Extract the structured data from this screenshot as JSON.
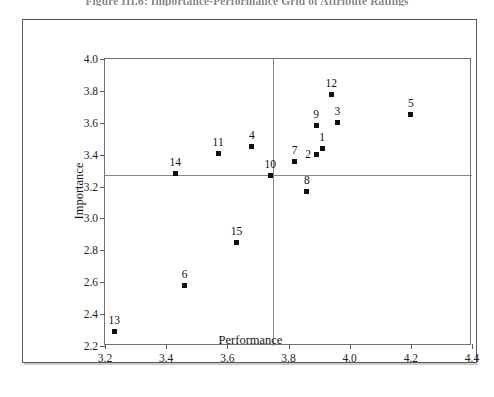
{
  "figure": {
    "caption": "Figure III.6: Importance-Performance Grid of Attribute Ratings"
  },
  "chart_data": {
    "type": "scatter",
    "title": "Figure III.6: Importance-Performance Grid of Attribute Ratings",
    "xlabel": "Performance",
    "ylabel": "Importance",
    "xlim": [
      3.2,
      4.4
    ],
    "ylim": [
      2.2,
      4.0
    ],
    "xticks": [
      "3.2",
      "3.4",
      "3.6",
      "3.8",
      "4.0",
      "4.2",
      "4.4"
    ],
    "yticks": [
      "2.2",
      "2.4",
      "2.6",
      "2.8",
      "3.0",
      "3.2",
      "3.4",
      "3.6",
      "3.8",
      "4.0"
    ],
    "xtick_values": [
      3.2,
      3.4,
      3.6,
      3.8,
      4.0,
      4.2,
      4.4
    ],
    "ytick_values": [
      2.2,
      2.4,
      2.6,
      2.8,
      3.0,
      3.2,
      3.4,
      3.6,
      3.8,
      4.0
    ],
    "grid": false,
    "legend": null,
    "quadrant_lines": {
      "x": 3.75,
      "y": 3.27
    },
    "points": [
      {
        "label": "1",
        "x": 3.91,
        "y": 3.44,
        "label_pos": "top"
      },
      {
        "label": "2",
        "x": 3.89,
        "y": 3.4,
        "label_pos": "left"
      },
      {
        "label": "3",
        "x": 3.96,
        "y": 3.6,
        "label_pos": "top"
      },
      {
        "label": "4",
        "x": 3.68,
        "y": 3.45,
        "label_pos": "top"
      },
      {
        "label": "5",
        "x": 4.2,
        "y": 3.65,
        "label_pos": "top"
      },
      {
        "label": "6",
        "x": 3.46,
        "y": 2.58,
        "label_pos": "top"
      },
      {
        "label": "7",
        "x": 3.82,
        "y": 3.36,
        "label_pos": "top"
      },
      {
        "label": "8",
        "x": 3.86,
        "y": 3.17,
        "label_pos": "top"
      },
      {
        "label": "9",
        "x": 3.89,
        "y": 3.58,
        "label_pos": "top"
      },
      {
        "label": "10",
        "x": 3.74,
        "y": 3.27,
        "label_pos": "top"
      },
      {
        "label": "11",
        "x": 3.57,
        "y": 3.41,
        "label_pos": "top"
      },
      {
        "label": "12",
        "x": 3.94,
        "y": 3.78,
        "label_pos": "top"
      },
      {
        "label": "13",
        "x": 3.23,
        "y": 2.29,
        "label_pos": "top"
      },
      {
        "label": "14",
        "x": 3.43,
        "y": 3.28,
        "label_pos": "top"
      },
      {
        "label": "15",
        "x": 3.63,
        "y": 2.85,
        "label_pos": "top"
      }
    ]
  },
  "colors": {
    "marker": "#101010",
    "axis": "#55595d",
    "quadrant_line": "#83878b",
    "frame": "#6e7276",
    "figure_border": "#555a5e",
    "background": "#ffffff"
  }
}
